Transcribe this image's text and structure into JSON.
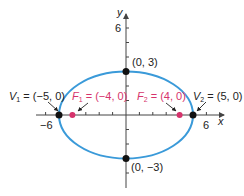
{
  "colors": {
    "ellipse": "#3a9ad9",
    "focus": "#d6336c",
    "vertex": "#111111",
    "axis": "#444444",
    "text": "#222222"
  },
  "axes": {
    "x_label": "x",
    "y_label": "y",
    "x_tick_labels": [
      {
        "value": -6,
        "text": "−6"
      },
      {
        "value": 6,
        "text": "6"
      }
    ],
    "y_tick_labels": [
      {
        "value": 6,
        "text": "6"
      }
    ]
  },
  "ellipse": {
    "center": [
      0,
      0
    ],
    "a": 5,
    "b": 3,
    "equation": "x^2/25 + y^2/9 = 1"
  },
  "points": {
    "v1": {
      "name": "V",
      "sub": "1",
      "coords": "(−5, 0)",
      "x": -5,
      "y": 0
    },
    "v2": {
      "name": "V",
      "sub": "2",
      "coords": "(5, 0)",
      "x": 5,
      "y": 0
    },
    "f1": {
      "name": "F",
      "sub": "1",
      "coords": "(−4, 0)",
      "x": -4,
      "y": 0
    },
    "f2": {
      "name": "F",
      "sub": "2",
      "coords": "(4, 0)",
      "x": 4,
      "y": 0
    },
    "top": {
      "label": "(0, 3)",
      "x": 0,
      "y": 3
    },
    "bottom": {
      "label": "(0, −3)",
      "x": 0,
      "y": -3
    }
  },
  "equals": "="
}
